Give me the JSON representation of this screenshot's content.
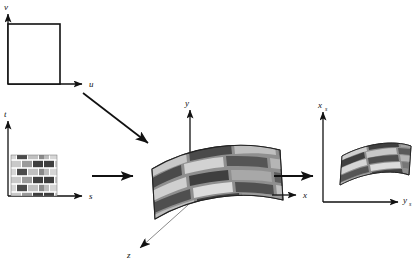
{
  "figure": {
    "background_color": "#ffffff",
    "line_color": "#111111",
    "width": 416,
    "height": 265
  },
  "panels": [
    {
      "id": "parameter-space",
      "name": "uv-parameter-space",
      "axes": [
        {
          "id": "v-axis",
          "label": "v",
          "subscript": "",
          "direction": "up"
        },
        {
          "id": "u-axis",
          "label": "u",
          "subscript": "",
          "direction": "right"
        }
      ],
      "content": "unit-square-outline"
    },
    {
      "id": "texture-space",
      "name": "st-texture-space",
      "axes": [
        {
          "id": "t-axis",
          "label": "t",
          "subscript": "",
          "direction": "up"
        },
        {
          "id": "s-axis",
          "label": "s",
          "subscript": "",
          "direction": "right"
        }
      ],
      "content": "brick-texture-swatch"
    },
    {
      "id": "object-space",
      "name": "xyz-object-space",
      "axes": [
        {
          "id": "y-axis",
          "label": "y",
          "subscript": "",
          "direction": "up"
        },
        {
          "id": "x-axis",
          "label": "x",
          "subscript": "",
          "direction": "right"
        },
        {
          "id": "z-axis",
          "label": "z",
          "subscript": "",
          "direction": "down-left"
        }
      ],
      "content": "curved-textured-surface"
    },
    {
      "id": "screen-space",
      "name": "screen-space",
      "axes": [
        {
          "id": "xs-axis",
          "label": "x",
          "subscript": "s",
          "direction": "up"
        },
        {
          "id": "ys-axis",
          "label": "y",
          "subscript": "s",
          "direction": "right"
        }
      ],
      "content": "projected-textured-surface"
    }
  ],
  "arrows": [
    {
      "id": "arrow-uv-to-object",
      "name": "arrow-parameter-to-object",
      "style": "diagonal"
    },
    {
      "id": "arrow-st-to-object",
      "name": "arrow-texture-to-object",
      "style": "horizontal"
    },
    {
      "id": "arrow-object-to-screen",
      "name": "arrow-object-to-screen",
      "style": "horizontal"
    }
  ],
  "texture": {
    "name": "brick-pattern",
    "brick_colors": [
      "#3f3f3f",
      "#d6d6d6",
      "#9a9a9a",
      "#5a5a5a",
      "#bdbdbd",
      "#777777"
    ],
    "mortar_color": "#ffffff",
    "rows": 5,
    "columns": 4
  }
}
